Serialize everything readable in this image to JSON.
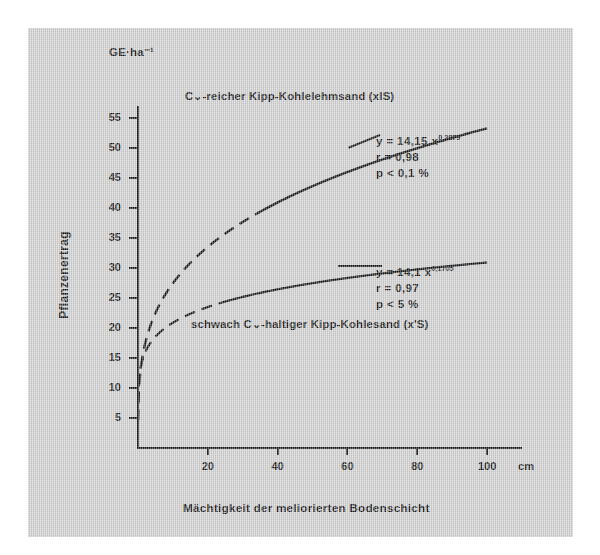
{
  "figure": {
    "unit_label": "GE·ha⁻¹",
    "y_axis_title": "Pflanzenertrag",
    "x_axis_title": "Mächtigkeit der meliorierten  Bodenschicht",
    "x_unit": "cm",
    "background_color": "#d2d2d2",
    "line_color": "#131313"
  },
  "chart_data": {
    "type": "line",
    "title": "",
    "xlabel": "Mächtigkeit der meliorierten Bodenschicht",
    "ylabel": "Pflanzenertrag",
    "x_unit": "cm",
    "y_unit": "GE·ha⁻¹",
    "xlim": [
      0,
      110
    ],
    "ylim": [
      0,
      57
    ],
    "xticks": [
      20,
      40,
      60,
      80,
      100
    ],
    "yticks": [
      5,
      10,
      15,
      20,
      25,
      30,
      35,
      40,
      45,
      50,
      55
    ],
    "grid": false,
    "legend": "inline-annotations",
    "series": [
      {
        "name": "C-reicher Kipp-Kohlelehmsand (xlS)",
        "label": "C⌄-reicher Kipp-Kohlelehmsand (xlS)",
        "equation": "y = 14,15 x",
        "exponent": "0,2879",
        "coefficient": 14.15,
        "power": 0.2879,
        "r_line": "r = 0,98",
        "p_line": "p < 0,1 %",
        "r": 0.98,
        "style": "dashed-then-solid",
        "x": [
          1,
          2,
          5,
          10,
          15,
          20,
          30,
          40,
          50,
          60,
          70,
          80,
          90,
          100
        ],
        "y": [
          14.15,
          17.3,
          21.9,
          26.7,
          29.9,
          32.5,
          36.5,
          39.7,
          42.3,
          44.5,
          46.5,
          48.3,
          49.9,
          51.4
        ]
      },
      {
        "name": "schwach C-haltiger Kipp-Kohlesand (x'S)",
        "label": "schwach C⌄-haltiger Kipp-Kohlesand (x'S)",
        "equation": "y = 14,1 x",
        "exponent": "0,1705",
        "coefficient": 14.1,
        "power": 0.1705,
        "r_line": "r = 0,97",
        "p_line": "p < 5 %",
        "r": 0.97,
        "style": "dashed-then-solid",
        "x": [
          1,
          2,
          5,
          10,
          15,
          20,
          30,
          40,
          50,
          60,
          70,
          80,
          90,
          100
        ],
        "y": [
          14.1,
          15.9,
          18.4,
          20.7,
          22.1,
          23.3,
          24.9,
          26.1,
          27.1,
          27.9,
          28.6,
          29.3,
          29.8,
          30.3
        ]
      }
    ]
  }
}
